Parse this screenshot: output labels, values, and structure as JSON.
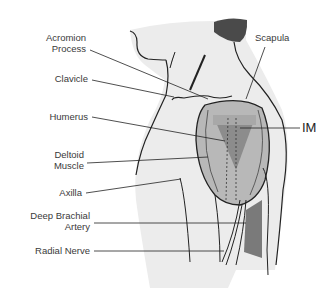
{
  "diagram": {
    "type": "anatomical-illustration",
    "labels": {
      "acromion_1": "Acromion",
      "acromion_2": "Process",
      "clavicle": "Clavicle",
      "humerus": "Humerus",
      "deltoid_1": "Deltoid",
      "deltoid_2": "Muscle",
      "axilla": "Axilla",
      "artery_1": "Deep Brachial",
      "artery_2": "Artery",
      "radial": "Radial Nerve",
      "scapula": "Scapula",
      "im": "IM"
    },
    "colors": {
      "skin": "#ececec",
      "muscle": "#b8b8b8",
      "injection_triangle": "#8c8c8c",
      "triangle_top": "#a8a8a8",
      "artery": "#7a7a7a",
      "hair": "#4a4a4a",
      "line": "#222222"
    }
  }
}
